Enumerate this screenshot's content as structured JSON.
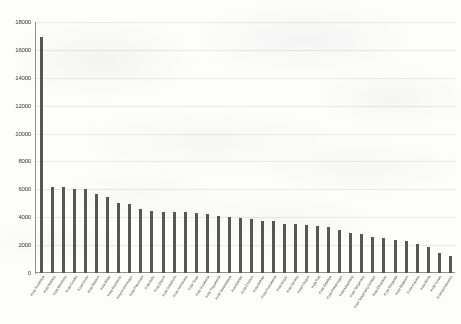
{
  "chart_data": {
    "type": "bar",
    "title": "",
    "xlabel": "",
    "ylabel": "",
    "ylim": [
      0,
      18000
    ],
    "yticks": [
      0,
      2000,
      4000,
      6000,
      8000,
      10000,
      12000,
      14000,
      16000,
      18000
    ],
    "ytick_labels": [
      "0",
      "2000",
      "4000",
      "6000",
      "8000",
      "10000",
      "12000",
      "14000",
      "16000",
      "18000"
    ],
    "grid": true,
    "legend": false,
    "bar_color": "#575757",
    "categories": [
      "Kota Surabaya",
      "Kota Malang",
      "Kota Bandung",
      "Kota Cimahi",
      "Kota Kediri",
      "Kota Madiun",
      "Kota Blitar",
      "Kota Mojokerto",
      "Kota Probolinggo",
      "Kota Pasuruan",
      "Kota Batu",
      "Kota Depok",
      "Kota Sukabumi",
      "Kota Semarang",
      "Kota Tegal",
      "Kota Surakarta",
      "Kota Yogyakarta",
      "Kota Tasikmalaya",
      "Kota Banjar",
      "Kota Cirebon",
      "Kota Bekasi",
      "Kota Purwakarta",
      "Kota Bogor",
      "Kota Serang",
      "Kota Cilegon",
      "Kota Pati",
      "Kota Salatiga",
      "Kota Pekalongan",
      "Kota Magelang",
      "Kota Tangerang",
      "Kota Tangerang Selatan",
      "Kota Denpasar",
      "Kota Singaraja",
      "Kota Mataram",
      "Kota Kupang",
      "Kota Bima",
      "Kota Tuban",
      "Kota Bondowoso"
    ],
    "values": [
      16900,
      6200,
      6150,
      6050,
      6000,
      5700,
      5450,
      5000,
      4950,
      4600,
      4450,
      4400,
      4350,
      4350,
      4300,
      4250,
      4100,
      4050,
      3950,
      3900,
      3750,
      3700,
      3550,
      3500,
      3450,
      3400,
      3300,
      3050,
      2900,
      2800,
      2600,
      2500,
      2400,
      2300,
      2100,
      1900,
      1400,
      1250
    ]
  }
}
